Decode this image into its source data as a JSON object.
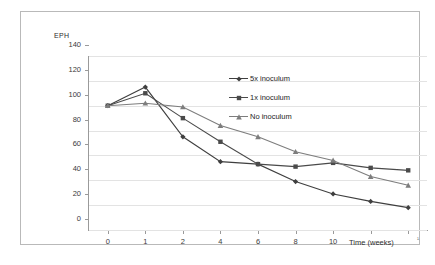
{
  "chart_data": {
    "type": "line",
    "title": "",
    "xlabel": "Time (weeks)",
    "ylabel": "EPH",
    "ylim": [
      0,
      140
    ],
    "ytick_step": 20,
    "yticks": [
      "140",
      "120",
      "100",
      "80",
      "60",
      "40",
      "20",
      "0"
    ],
    "categories": [
      "0",
      "1",
      "2",
      "4",
      "6",
      "8",
      "10",
      "",
      ""
    ],
    "xtick_labels": [
      "0",
      "1",
      "2",
      "4",
      "6",
      "8",
      "10"
    ],
    "grid": true,
    "legend_position": "inside-top-right",
    "series": [
      {
        "name": "5x inoculum",
        "marker": "diamond",
        "color": "#3f3f3f",
        "values": [
          100,
          115,
          75,
          55,
          53,
          39,
          29,
          23,
          18
        ]
      },
      {
        "name": "1x inoculum",
        "marker": "square",
        "color": "#4a4a4a",
        "values": [
          100,
          110,
          90,
          71,
          53,
          51,
          54,
          50,
          48
        ]
      },
      {
        "name": "No inoculum",
        "marker": "triangle",
        "color": "#7d7d7d",
        "values": [
          100,
          102,
          99,
          84,
          75,
          63,
          56,
          43,
          36
        ]
      }
    ]
  },
  "axis": {
    "y_label": "EPH",
    "x_label": "Time (weeks)",
    "x_label_tail": "¹"
  },
  "legend": {
    "items": [
      {
        "label": "5x inoculum"
      },
      {
        "label": "1x inoculum"
      },
      {
        "label": "No inoculum"
      }
    ]
  }
}
